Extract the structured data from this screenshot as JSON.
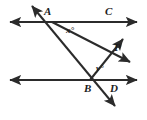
{
  "figure": {
    "stroke_color": "#2b2b2b",
    "background_color": "#ffffff",
    "line_width": 2,
    "labels": {
      "point_a": "A",
      "point_b": "B",
      "point_c": "C",
      "point_d": "D",
      "point_p": "P",
      "angle_x": "x°",
      "angle_y": "y°"
    },
    "lines": [
      {
        "name": "top-parallel-line",
        "through_points": [
          "A",
          "C"
        ],
        "y": 22,
        "x_start": 8,
        "x_end": 139,
        "arrows": "both"
      },
      {
        "name": "bottom-parallel-line",
        "through_points": [
          "B",
          "D"
        ],
        "y": 80,
        "x_start": 8,
        "x_end": 139,
        "arrows": "both"
      },
      {
        "name": "transversal-line-ab",
        "through_points": [
          "A",
          "B"
        ],
        "x1": 30,
        "y1": 3,
        "x2": 117,
        "y2": 109,
        "arrows": "both"
      },
      {
        "name": "ray-a-through-p",
        "from": "A",
        "x1": 52,
        "y1": 22,
        "x2": 132,
        "y2": 63,
        "arrows": "end"
      },
      {
        "name": "ray-b-through-p",
        "from": "B",
        "x1": 90,
        "y1": 80,
        "x2": 125,
        "y2": 37,
        "arrows": "end"
      }
    ],
    "points": [
      {
        "name": "A",
        "x": 52,
        "y": 22,
        "label_x": 44,
        "label_y": 8
      },
      {
        "name": "C",
        "x": 110,
        "y": 22,
        "label_x": 106,
        "label_y": 8
      },
      {
        "name": "B",
        "x": 90,
        "y": 80,
        "label_x": 85,
        "label_y": 84
      },
      {
        "name": "D",
        "x": 112,
        "y": 80,
        "label_x": 110,
        "label_y": 84
      },
      {
        "name": "P",
        "x": 110,
        "y": 53,
        "label_x": 114,
        "label_y": 43
      }
    ],
    "angles": [
      {
        "name": "x",
        "label": "x°",
        "vertex": "A",
        "label_x": 67,
        "label_y": 27
      },
      {
        "name": "y",
        "label": "y°",
        "vertex": "B",
        "label_x": 96,
        "label_y": 66
      }
    ]
  }
}
